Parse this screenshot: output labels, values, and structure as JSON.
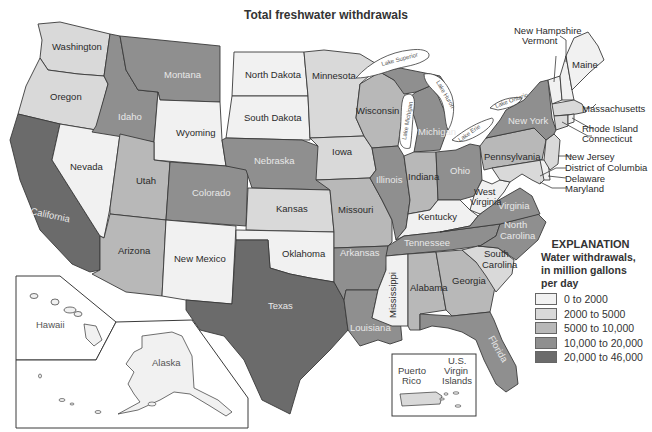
{
  "title": "Total freshwater withdrawals",
  "legend": {
    "heading": "EXPLANATION",
    "subheading_lines": [
      "Water withdrawals,",
      "in million gallons",
      "per day"
    ],
    "classes": [
      {
        "label": "0 to 2000",
        "color": "#f1f1f1"
      },
      {
        "label": "2000 to 5000",
        "color": "#d9d9d9"
      },
      {
        "label": "5000 to 10,000",
        "color": "#b8b8b8"
      },
      {
        "label": "10,000 to 20,000",
        "color": "#8f8f8f"
      },
      {
        "label": "20,000 to 46,000",
        "color": "#6b6b6b"
      }
    ]
  },
  "states": {
    "washington": "Washington",
    "oregon": "Oregon",
    "california": "California",
    "nevada": "Nevada",
    "idaho": "Idaho",
    "montana": "Montana",
    "wyoming": "Wyoming",
    "utah": "Utah",
    "arizona": "Arizona",
    "colorado": "Colorado",
    "new_mexico": "New Mexico",
    "north_dakota": "North Dakota",
    "south_dakota": "South Dakota",
    "nebraska": "Nebraska",
    "kansas": "Kansas",
    "oklahoma": "Oklahoma",
    "texas": "Texas",
    "minnesota": "Minnesota",
    "iowa": "Iowa",
    "missouri": "Missouri",
    "arkansas": "Arkansas",
    "louisiana": "Louisiana",
    "wisconsin": "Wisconsin",
    "illinois": "Illinois",
    "michigan": "Michigan",
    "indiana": "Indiana",
    "ohio": "Ohio",
    "kentucky": "Kentucky",
    "tennessee": "Tennessee",
    "mississippi": "Mississippi",
    "alabama": "Alabama",
    "georgia": "Georgia",
    "florida": "Florida",
    "south_carolina": "South",
    "south_carolina2": "Carolina",
    "north_carolina": "North",
    "north_carolina2": "Carolina",
    "virginia": "Virginia",
    "west_virginia": "West",
    "west_virginia2": "Virginia",
    "pennsylvania": "Pennsylvania",
    "new_york": "New York",
    "vermont": "Vermont",
    "new_hampshire": "New Hampshire",
    "maine": "Maine",
    "massachusetts": "Massachusetts",
    "rhode_island": "Rhode Island",
    "connecticut": "Connecticut",
    "new_jersey": "New Jersey",
    "district_of_columbia": "District of Columbia",
    "delaware": "Delaware",
    "maryland": "Maryland",
    "hawaii": "Hawaii",
    "alaska": "Alaska",
    "puerto_rico": "Puerto",
    "puerto_rico2": "Rico",
    "usvi1": "U.S.",
    "usvi2": "Virgin",
    "usvi3": "Islands"
  },
  "lakes": {
    "superior": "Lake Superior",
    "michigan": "Lake Michigan",
    "huron": "Lake Huron",
    "erie": "Lake Erie",
    "ontario": "Lake Ontario"
  },
  "classification": {
    "0 to 2000": [
      "North Dakota",
      "South Dakota",
      "Oklahoma",
      "Maine",
      "New Hampshire",
      "Vermont",
      "Rhode Island",
      "Delaware",
      "Nevada",
      "New Mexico",
      "West Virginia",
      "Kentucky",
      "Mississippi",
      "Hawaii",
      "Alaska",
      "Puerto Rico",
      "District of Columbia"
    ],
    "2000 to 5000": [
      "Minnesota",
      "Iowa",
      "Kansas",
      "Wyoming",
      "Massachusetts",
      "Connecticut",
      "New Jersey",
      "Maryland",
      "South Carolina",
      "Oregon",
      "Washington"
    ],
    "5000 to 10,000": [
      "Utah",
      "Arizona",
      "Missouri",
      "Wisconsin",
      "Indiana",
      "Pennsylvania",
      "Alabama",
      "Georgia"
    ],
    "10,000 to 20,000": [
      "Montana",
      "Idaho",
      "Colorado",
      "Nebraska",
      "Illinois",
      "Michigan",
      "Ohio",
      "New York",
      "Virginia",
      "North Carolina",
      "Tennessee",
      "Arkansas",
      "Louisiana",
      "Florida"
    ],
    "20,000 to 46,000": [
      "California",
      "Texas"
    ]
  }
}
